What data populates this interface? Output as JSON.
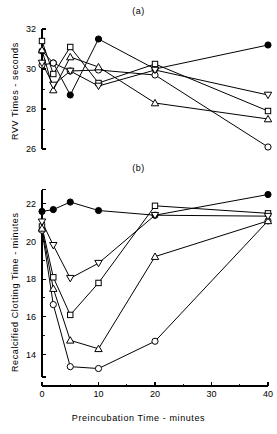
{
  "figure": {
    "background": "#ffffff",
    "ink_color": "#000000",
    "panel_a_label": "(a)",
    "panel_b_label": "(b)"
  },
  "chart_data": [
    {
      "type": "line",
      "panel": "(a)",
      "title": "(a)",
      "xlabel": "",
      "ylabel": "RVV Times - seconds",
      "x": [
        0,
        2,
        5,
        10,
        20,
        40
      ],
      "xlim": [
        0,
        40
      ],
      "ylim": [
        25.6,
        32.2
      ],
      "xticks": [
        0,
        10,
        20,
        30,
        40
      ],
      "xticklabels": [
        "",
        "",
        "",
        "",
        ""
      ],
      "yticks": [
        26,
        28,
        30,
        32
      ],
      "yticklabels": [
        "26",
        "28",
        "30",
        "32"
      ],
      "yminorticks": [
        27,
        29,
        31
      ],
      "grid": false,
      "legend": "none",
      "series": [
        {
          "name": "filled-circle",
          "marker": "filled-circle",
          "values": [
            30.9,
            30.3,
            28.7,
            31.5,
            30.0,
            31.2
          ]
        },
        {
          "name": "open-circle",
          "marker": "open-circle",
          "values": [
            30.2,
            30.3,
            29.9,
            29.95,
            29.7,
            26.1
          ]
        },
        {
          "name": "open-square",
          "marker": "open-square",
          "values": [
            31.4,
            29.75,
            31.1,
            29.3,
            30.25,
            27.9
          ]
        },
        {
          "name": "open-triangle-up",
          "marker": "open-triangle-up",
          "values": [
            30.95,
            28.95,
            30.6,
            30.1,
            28.3,
            27.5
          ]
        },
        {
          "name": "open-triangle-down",
          "marker": "open-triangle-down",
          "values": [
            30.3,
            29.2,
            29.9,
            29.15,
            29.95,
            28.7
          ]
        }
      ]
    },
    {
      "type": "line",
      "panel": "(b)",
      "title": "(b)",
      "xlabel": "Preincubation  Time - minutes",
      "ylabel": "Recalcified  Clotting Time - minutes",
      "x": [
        0,
        2,
        5,
        10,
        20,
        40
      ],
      "xlim": [
        0,
        40
      ],
      "ylim": [
        12.8,
        22.9
      ],
      "xticks": [
        0,
        10,
        20,
        30,
        40
      ],
      "xticklabels": [
        "0",
        "10",
        "20",
        "30",
        "40"
      ],
      "xminorticks": [
        5,
        15,
        25,
        35
      ],
      "yticks": [
        14,
        16,
        18,
        20,
        22
      ],
      "yticklabels": [
        "14",
        "16",
        "18",
        "20",
        "22"
      ],
      "yminorticks": [
        15,
        17,
        19,
        21
      ],
      "grid": false,
      "legend": "none",
      "series": [
        {
          "name": "filled-circle",
          "marker": "filled-circle",
          "values": [
            21.6,
            21.7,
            22.1,
            21.65,
            21.4,
            22.5
          ]
        },
        {
          "name": "open-circle",
          "marker": "open-circle",
          "values": [
            20.6,
            16.65,
            13.35,
            13.25,
            14.7,
            21.1
          ]
        },
        {
          "name": "open-square",
          "marker": "open-square",
          "values": [
            20.8,
            18.1,
            16.1,
            17.8,
            21.9,
            21.5
          ]
        },
        {
          "name": "open-triangle-up",
          "marker": "open-triangle-up",
          "values": [
            20.7,
            17.5,
            14.75,
            14.3,
            19.2,
            21.1
          ]
        },
        {
          "name": "open-triangle-down",
          "marker": "open-triangle-down",
          "values": [
            21.05,
            19.8,
            18.05,
            18.85,
            21.4,
            21.35
          ]
        }
      ]
    }
  ]
}
